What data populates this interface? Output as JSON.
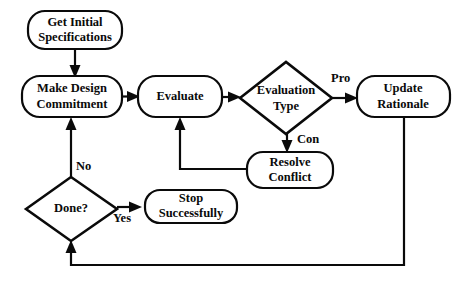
{
  "diagram": {
    "background_color": "#ffffff",
    "line_color": "#0a0a0a",
    "nodes": [
      {
        "id": "get-initial-specifications",
        "shape": "rounded-rect",
        "line1": "Get Initial",
        "line2": "Specifications",
        "x": 28,
        "y": 11,
        "w": 94,
        "h": 38
      },
      {
        "id": "make-design-commitment",
        "shape": "rounded-rect",
        "line1": "Make Design",
        "line2": "Commitment",
        "x": 22,
        "y": 76,
        "w": 100,
        "h": 41
      },
      {
        "id": "evaluate",
        "shape": "rounded-rect",
        "line1": "Evaluate",
        "line2": "",
        "x": 138,
        "y": 76,
        "w": 84,
        "h": 41
      },
      {
        "id": "evaluation-type",
        "shape": "diamond",
        "line1": "Evaluation",
        "line2": "Type",
        "x": 240,
        "y": 62,
        "w": 92,
        "h": 72
      },
      {
        "id": "update-rationale",
        "shape": "rounded-rect",
        "line1": "Update",
        "line2": "Rationale",
        "x": 357,
        "y": 76,
        "w": 93,
        "h": 41
      },
      {
        "id": "resolve-conflict",
        "shape": "rounded-rect",
        "line1": "Resolve",
        "line2": "Conflict",
        "x": 247,
        "y": 152,
        "w": 86,
        "h": 36
      },
      {
        "id": "done",
        "shape": "diamond",
        "line1": "Done?",
        "line2": "",
        "x": 26,
        "y": 177,
        "w": 91,
        "h": 64
      },
      {
        "id": "stop-successfully",
        "shape": "rounded-rect",
        "line1": "Stop",
        "line2": "Successfully",
        "x": 145,
        "y": 190,
        "w": 92,
        "h": 33
      }
    ],
    "edge_labels": [
      {
        "id": "label-pro",
        "text": "Pro",
        "x": 331,
        "y": 79
      },
      {
        "id": "label-con",
        "text": "Con",
        "x": 297,
        "y": 140
      },
      {
        "id": "label-no",
        "text": "No",
        "x": 76,
        "y": 167
      },
      {
        "id": "label-yes",
        "text": "Yes",
        "x": 122,
        "y": 219
      }
    ],
    "edges": [
      {
        "id": "edge-specs-to-commitment",
        "from": "get-initial-specifications",
        "to": "make-design-commitment"
      },
      {
        "id": "edge-commitment-to-evaluate",
        "from": "make-design-commitment",
        "to": "evaluate"
      },
      {
        "id": "edge-evaluate-to-evaluation-type",
        "from": "evaluate",
        "to": "evaluation-type"
      },
      {
        "id": "edge-evaluation-type-pro-to-update-rationale",
        "from": "evaluation-type",
        "to": "update-rationale",
        "label": "Pro"
      },
      {
        "id": "edge-evaluation-type-con-to-resolve-conflict",
        "from": "evaluation-type",
        "to": "resolve-conflict",
        "label": "Con"
      },
      {
        "id": "edge-resolve-conflict-to-evaluate",
        "from": "resolve-conflict",
        "to": "evaluate"
      },
      {
        "id": "edge-update-rationale-to-done",
        "from": "update-rationale",
        "to": "done"
      },
      {
        "id": "edge-done-no-to-commitment",
        "from": "done",
        "to": "make-design-commitment",
        "label": "No"
      },
      {
        "id": "edge-done-yes-to-stop",
        "from": "done",
        "to": "stop-successfully",
        "label": "Yes"
      }
    ]
  }
}
